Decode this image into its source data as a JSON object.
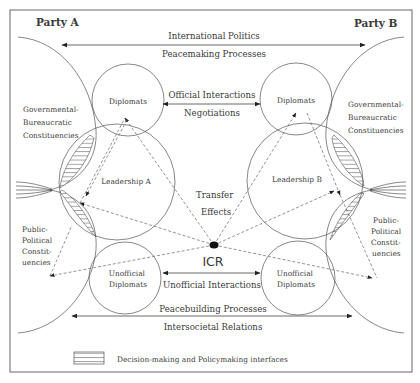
{
  "parties": {
    "a": "Party A",
    "b": "Party B"
  },
  "top_arrow": {
    "line1": "International Politics",
    "line2": "Peacemaking Processes"
  },
  "official": {
    "line1": "Official Interactions",
    "line2": "Negotiations"
  },
  "nodes": {
    "diplomats_a": "Diplomats",
    "diplomats_b": "Diplomats",
    "leadership_a": "Leadership A",
    "leadership_b": "Leadership B",
    "unofficial_a": [
      "Unofficial",
      "Diplomats"
    ],
    "unofficial_b": [
      "Unofficial",
      "Diplomats"
    ],
    "icr": "ICR"
  },
  "constituencies": {
    "gov_a": [
      "Governmental-",
      "Bureaucratic",
      "Constituencies"
    ],
    "gov_b": [
      "Governmental-",
      "Bureaucratic",
      "Constituencies"
    ],
    "public_a": [
      "Public-",
      "Political",
      "Constit-",
      "uencies"
    ],
    "public_b": [
      "Public-",
      "Political",
      "Constit-",
      "uencies"
    ]
  },
  "transfer": {
    "line1": "Transfer",
    "line2": "Effects"
  },
  "unofficial_interactions": "Unofficial Interactions",
  "bottom_arrow": {
    "line1": "Peacebuilding Processes",
    "line2": "Intersocietal Relations"
  },
  "legend": {
    "label": "Decision-making and Policymaking interfaces"
  }
}
